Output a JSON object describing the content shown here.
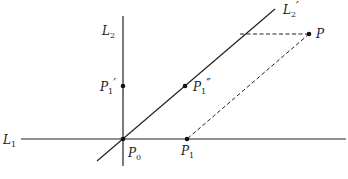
{
  "diagram": {
    "type": "geometric-construction",
    "lines": [
      {
        "id": "L1",
        "label": "L",
        "sub": "1",
        "style": "solid",
        "from": [
          21,
          139
        ],
        "to": [
          346,
          139
        ]
      },
      {
        "id": "L2",
        "label": "L",
        "sub": "2",
        "style": "solid",
        "from": [
          123,
          16
        ],
        "to": [
          123,
          166
        ]
      },
      {
        "id": "L2prime",
        "label": "L",
        "sub": "2",
        "prime": "′",
        "style": "solid",
        "from": [
          97,
          161
        ],
        "to": [
          275,
          9
        ]
      }
    ],
    "dashed": [
      {
        "id": "P-to-L2prime",
        "from": [
          309,
          34
        ],
        "to": [
          239,
          34
        ]
      },
      {
        "id": "P-to-P1",
        "from": [
          309,
          34
        ],
        "to": [
          187,
          139
        ]
      }
    ],
    "points": [
      {
        "id": "P0",
        "label": "P",
        "sub": "0",
        "prime": "",
        "at": [
          123,
          139
        ]
      },
      {
        "id": "P1",
        "label": "P",
        "sub": "1",
        "prime": "",
        "at": [
          187,
          139
        ]
      },
      {
        "id": "P1prime",
        "label": "P",
        "sub": "1",
        "prime": "′",
        "at": [
          123,
          86
        ]
      },
      {
        "id": "P1dprime",
        "label": "P",
        "sub": "1",
        "prime": "″",
        "at": [
          185,
          86
        ]
      },
      {
        "id": "P",
        "label": "P",
        "sub": "",
        "prime": "",
        "at": [
          309,
          34
        ]
      }
    ],
    "labels": {
      "L1": {
        "main": "L",
        "sub": "1",
        "prime": ""
      },
      "L2": {
        "main": "L",
        "sub": "2",
        "prime": ""
      },
      "L2prime": {
        "main": "L",
        "sub": "2",
        "prime": "′"
      },
      "P0": {
        "main": "P",
        "sub": "0",
        "prime": ""
      },
      "P1": {
        "main": "P",
        "sub": "1",
        "prime": ""
      },
      "P1prime": {
        "main": "P",
        "sub": "1",
        "prime": "′"
      },
      "P1dprime": {
        "main": "P",
        "sub": "1",
        "prime": "″"
      },
      "P": {
        "main": "P",
        "sub": "",
        "prime": ""
      }
    },
    "colors": {
      "line": "#222222",
      "background": "#ffffff"
    }
  }
}
